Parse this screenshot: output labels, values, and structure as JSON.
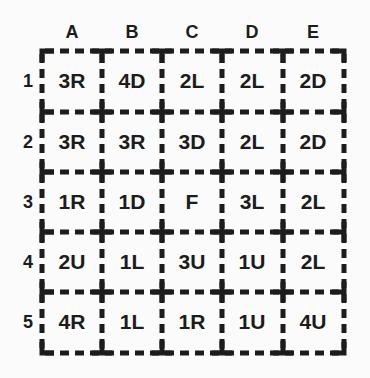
{
  "puzzle": {
    "columns": [
      "A",
      "B",
      "C",
      "D",
      "E"
    ],
    "rows": [
      "1",
      "2",
      "3",
      "4",
      "5"
    ],
    "cells": [
      [
        "3R",
        "4D",
        "2L",
        "2L",
        "2D"
      ],
      [
        "3R",
        "3R",
        "3D",
        "2L",
        "2D"
      ],
      [
        "1R",
        "1D",
        "F",
        "3L",
        "2L"
      ],
      [
        "2U",
        "1L",
        "3U",
        "1U",
        "2L"
      ],
      [
        "4R",
        "1L",
        "1R",
        "1U",
        "4U"
      ]
    ],
    "colors": {
      "ink": "#1c1c1c",
      "background": "#fbfbfb"
    }
  }
}
